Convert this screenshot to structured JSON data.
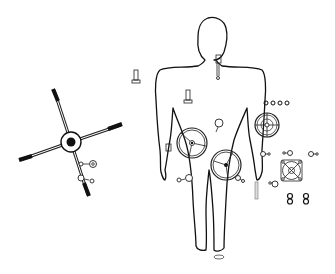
{
  "figure": {
    "colors": {
      "background": "#ffffff",
      "stroke": "#111111",
      "handle": "#111111"
    }
  },
  "elements": {
    "human_figure": {
      "label": ""
    },
    "cross_handle": {
      "label": ""
    },
    "handwheel_left": {
      "label": ""
    },
    "handwheel_center": {
      "label": ""
    },
    "handwheel_right": {
      "label": ""
    },
    "square_flange": {
      "label": ""
    },
    "ring_row": {
      "count": 4
    },
    "figure_eight_pair": {
      "count": 2
    }
  }
}
